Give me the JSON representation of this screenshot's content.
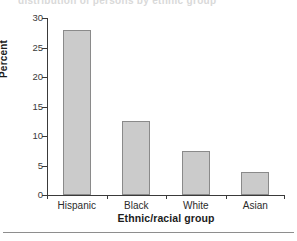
{
  "figure": {
    "bleed_text": "distribution of persons by ethnic group",
    "y_axis_label": "Percent",
    "x_axis_label": "Ethnic/racial group",
    "bar_fill_color": "#cbcbcb",
    "bar_border_color": "#8a8a8a",
    "axis_color": "#3a3a3a",
    "background_color": "#ffffff"
  },
  "chart_data": {
    "type": "bar",
    "title": "",
    "xlabel": "Ethnic/racial group",
    "ylabel": "Percent",
    "categories": [
      "Hispanic",
      "Black",
      "White",
      "Asian"
    ],
    "values": [
      28.0,
      12.5,
      7.4,
      3.9
    ],
    "ylim": [
      0,
      30
    ],
    "yticks": [
      0,
      5,
      10,
      15,
      20,
      25,
      30
    ],
    "ytick_labels": [
      "0",
      "5",
      "10",
      "15",
      "20",
      "25",
      "30"
    ],
    "grid": false,
    "legend": false,
    "series": [
      {
        "name": "Percent",
        "values": [
          28.0,
          12.5,
          7.4,
          3.9
        ]
      }
    ]
  }
}
